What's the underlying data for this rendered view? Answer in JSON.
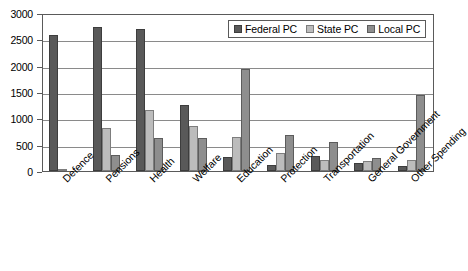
{
  "chart_data": {
    "type": "bar",
    "title": "",
    "subtitle": "",
    "xlabel": "",
    "ylabel": "",
    "ylim": [
      0,
      3000
    ],
    "ytick_labels": [
      "3000",
      "2500",
      "2000",
      "1500",
      "1000",
      "500",
      "0"
    ],
    "ytick_values": [
      3000,
      2500,
      2000,
      1500,
      1000,
      500,
      0
    ],
    "grid": true,
    "legend_position": "top-right",
    "categories": [
      "Defence",
      "Pensions",
      "Health",
      "Welfare",
      "Education",
      "Protection",
      "Transportation",
      "General Government",
      "Other Spending"
    ],
    "series": [
      {
        "name": "Federal PC",
        "key": "federal",
        "color": "#595959",
        "values": [
          2590,
          2740,
          2705,
          1250,
          270,
          110,
          290,
          160,
          95
        ]
      },
      {
        "name": "State PC",
        "key": "state",
        "color": "#bcbcbc",
        "values": [
          20,
          820,
          1150,
          850,
          650,
          335,
          200,
          195,
          200
        ]
      },
      {
        "name": "Local PC",
        "key": "local",
        "color": "#8e8e8e",
        "values": [
          0,
          295,
          635,
          630,
          1945,
          685,
          555,
          255,
          1435
        ]
      }
    ]
  },
  "legend": {
    "entries": [
      {
        "label": "Federal PC",
        "key": "federal"
      },
      {
        "label": "State PC",
        "key": "state"
      },
      {
        "label": "Local PC",
        "key": "local"
      }
    ]
  }
}
